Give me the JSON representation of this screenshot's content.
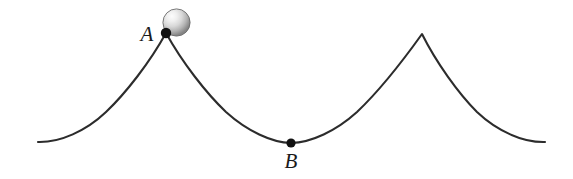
{
  "figure": {
    "background_color": "#ffffff",
    "curve_color": "#2c2c2c",
    "curve_width": 2.1,
    "marker_color": "#111111",
    "label_color": "#1a1a1a",
    "label_font_size": 21
  },
  "labels": {
    "point_a": "A",
    "point_b": "B"
  },
  "ball": {
    "name": "ball",
    "center_x": 176.5,
    "center_y": 22.5,
    "radius": 13.6,
    "highlight_color": "#fbfbfb",
    "midtone_color": "#d2d2d2",
    "shadow_color": "#7e7e7e",
    "edge_color": "#6a6a6a"
  },
  "markers": {
    "point_a": {
      "x": 166,
      "y": 33,
      "radius": 5.2
    },
    "point_b": {
      "x": 291,
      "y": 143,
      "radius": 4.6
    }
  },
  "label_positions": {
    "point_a": {
      "x": 147,
      "y": 41
    },
    "point_b": {
      "x": 291,
      "y": 168
    }
  },
  "chart_data": {
    "type": "line",
    "xlabel": "",
    "ylabel": "",
    "xlim": [
      38,
      545
    ],
    "ylim": [
      179,
      0
    ],
    "grid": false,
    "legend": null,
    "annotations": [
      {
        "label": "A",
        "x": 166,
        "y": 33,
        "note": "cusp / peak, ball resting here"
      },
      {
        "label": "B",
        "x": 291,
        "y": 143,
        "note": "lowest point of the arch"
      }
    ],
    "series": [
      {
        "name": "cycloid",
        "path": "M 38,142 C 60,142.6 86,131 106,112 C 126,93 150,62 166,33 C 182,62 206,93 226,112 C 247,131 272,142.6 291,143 C 311,142.6 336,131 357,112 C 377,93 402,62 422,34 C 436,62 458,93 477,112 C 497,131 523,142.6 545,142",
        "key_points": [
          {
            "x": 38,
            "y": 142
          },
          {
            "x": 166,
            "y": 33
          },
          {
            "x": 291,
            "y": 143
          },
          {
            "x": 422,
            "y": 34
          },
          {
            "x": 545,
            "y": 142
          }
        ]
      }
    ]
  }
}
